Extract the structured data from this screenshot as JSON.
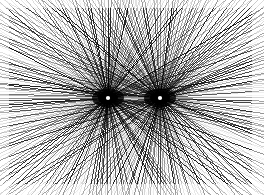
{
  "artwork": {
    "title": "Dual Radial Ray Burst",
    "type": "generative-line-art",
    "medium": "raster-image",
    "canvas": {
      "width": 264,
      "height": 195,
      "background_color": "#ffffff",
      "ink_color": "#000000"
    },
    "margins": {
      "top": 8,
      "right": 12,
      "bottom": 11,
      "left": 9
    },
    "composition": {
      "symmetry": "bilateral-horizontal-and-vertical",
      "description": "Two point foci each radiating straight rays outward in all directions; rays overlap to form moire interference, darkest immediately around each focus and fading toward the frame edges.",
      "focus_count": 2,
      "axis_line_y": 98,
      "center_x": 134
    },
    "foci": [
      {
        "id": "focus-left",
        "label": "Left focus",
        "cx": 108,
        "cy": 98,
        "ray_count": 200,
        "core_radius": 2.1,
        "core_color": "#ffffff",
        "blob_color": "#000000"
      },
      {
        "id": "focus-right",
        "label": "Right focus",
        "cx": 160,
        "cy": 98,
        "ray_count": 200,
        "core_radius": 2.1,
        "core_color": "#ffffff",
        "blob_color": "#000000"
      }
    ],
    "ray_style": {
      "min_stroke_width": 0.28,
      "max_stroke_width": 0.95,
      "min_opacity": 0.1,
      "max_opacity": 0.95,
      "stroke_color": "#000000",
      "fade_start_radius": 26,
      "fade_end_radius": 160
    }
  }
}
